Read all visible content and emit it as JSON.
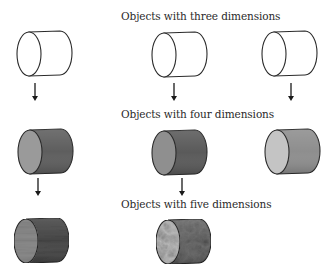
{
  "labels": {
    "three": "Objects with three dimensions",
    "four": "Objects with four dimensions",
    "five": "Objects with five dimensions"
  },
  "rows": [
    {
      "name": "three-dimensions",
      "objects": [
        {
          "style": "outline",
          "face_color": "#ffffff",
          "body_color": "#ffffff"
        },
        {
          "style": "outline",
          "face_color": "#ffffff",
          "body_color": "#ffffff"
        },
        {
          "style": "outline",
          "face_color": "#ffffff",
          "body_color": "#ffffff"
        }
      ]
    },
    {
      "name": "four-dimensions",
      "objects": [
        {
          "style": "shaded",
          "face_color": "#9a9a9a",
          "body_color": "#5e5e5e"
        },
        {
          "style": "shaded",
          "face_color": "#8f8f8f",
          "body_color": "#5a5a5a"
        },
        {
          "style": "shaded",
          "face_color": "#c4c4c4",
          "body_color": "#8e8e8e"
        }
      ]
    },
    {
      "name": "five-dimensions",
      "objects": [
        {
          "style": "textured-striated",
          "face_color": "#8c8c8c",
          "body_color": "#4a4a4a"
        },
        {
          "style": "textured-marbled",
          "face_color": "#b8b8b8",
          "body_color": "#6a6a6a"
        }
      ]
    }
  ],
  "arrows": [
    {
      "from_row": 0,
      "to_row": 1,
      "column": 0
    },
    {
      "from_row": 0,
      "to_row": 1,
      "column": 1
    },
    {
      "from_row": 0,
      "to_row": 1,
      "column": 2
    },
    {
      "from_row": 1,
      "to_row": 2,
      "column": 0
    },
    {
      "from_row": 1,
      "to_row": 2,
      "column": 1
    }
  ],
  "colors": {
    "outline": "#2b2b2b",
    "text": "#2a2a2a",
    "arrow": "#1a1a1a"
  }
}
